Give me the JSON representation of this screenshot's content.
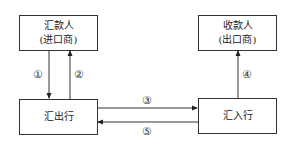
{
  "nodes": {
    "remitter": {
      "line1": "汇款人",
      "line2": "(进口商)"
    },
    "payee": {
      "line1": "收款人",
      "line2": "(出口商)"
    },
    "remitting_bank": {
      "line1": "汇出行"
    },
    "paying_bank": {
      "line1": "汇入行"
    }
  },
  "edges": [
    {
      "id": "1",
      "label": "①",
      "from": "汇款人",
      "to": "汇出行"
    },
    {
      "id": "2",
      "label": "②",
      "from": "汇出行",
      "to": "汇款人"
    },
    {
      "id": "3",
      "label": "③",
      "from": "汇出行",
      "to": "汇入行"
    },
    {
      "id": "4",
      "label": "④",
      "from": "汇入行",
      "to": "收款人"
    },
    {
      "id": "5",
      "label": "⑤",
      "from": "汇入行",
      "to": "汇出行"
    }
  ],
  "colors": {
    "line": "#333333",
    "background": "#ffffff"
  }
}
